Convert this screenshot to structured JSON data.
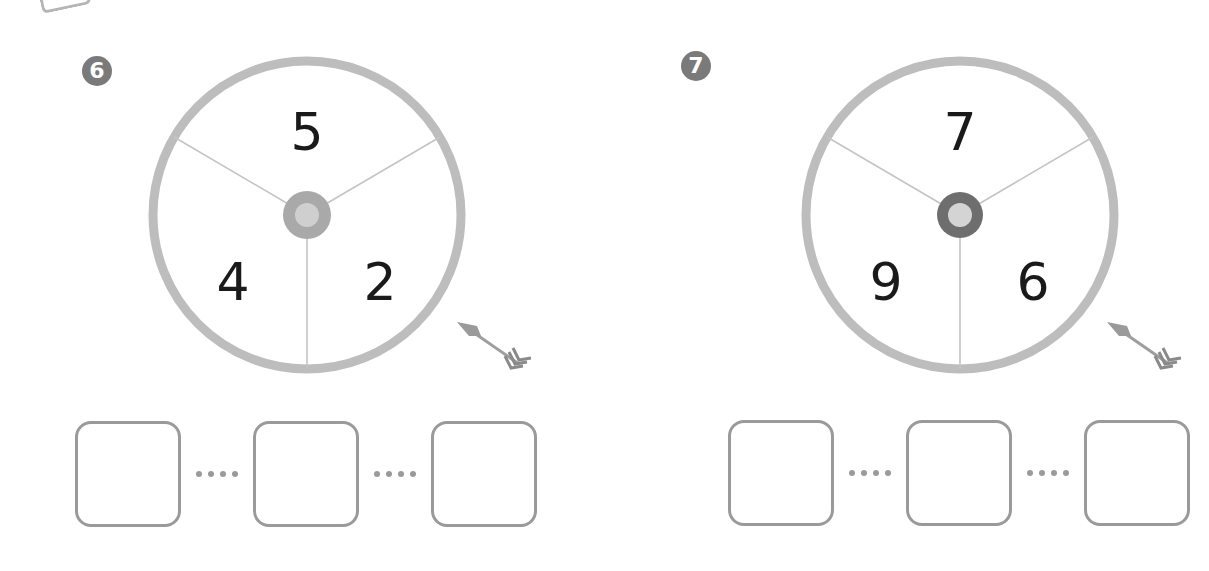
{
  "problems": [
    {
      "label": "6",
      "spinner": {
        "top": "5",
        "left": "4",
        "right": "2",
        "hub_color": "#a9a9a9",
        "hub_inner": "#cfcfcf"
      },
      "answer_boxes": [
        "",
        "",
        ""
      ],
      "separator": "····"
    },
    {
      "label": "7",
      "spinner": {
        "top": "7",
        "left": "9",
        "right": "6",
        "hub_color": "#6e6e6e",
        "hub_inner": "#d4d4d4"
      },
      "answer_boxes": [
        "",
        "",
        ""
      ],
      "separator": "····"
    }
  ],
  "colors": {
    "ring": "#bdbdbd",
    "divider": "#bdbdbd",
    "badge": "#7a7a7a",
    "box_border": "#9a9a9a"
  }
}
